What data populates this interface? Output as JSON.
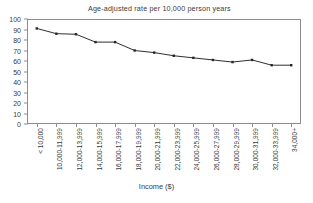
{
  "chart_data": {
    "type": "line",
    "title": "Age-adjusted rate per 10,000 person years",
    "xlabel": "Income ($)",
    "ylabel": "",
    "ylim": [
      0,
      100
    ],
    "yticks": [
      0,
      10,
      20,
      30,
      40,
      50,
      60,
      70,
      80,
      90,
      100
    ],
    "grid": false,
    "legend": "none",
    "marker": "square",
    "categories": [
      "< 10,000",
      "10,000-11,999",
      "12,000-13,999",
      "14,000-15,999",
      "16,000-17,999",
      "18,000-19,999",
      "20,000-21,999",
      "22,000-23,999",
      "24,000-25,999",
      "26,000-27,999",
      "28,000-29,999",
      "30,000-31,999",
      "32,000-33,999",
      "34,000+"
    ],
    "values": [
      91,
      86,
      85.5,
      78,
      78,
      70,
      68,
      65,
      63,
      61,
      59,
      61,
      56,
      56
    ],
    "series": [
      {
        "name": "Age-adjusted rate",
        "values": [
          91,
          86,
          85.5,
          78,
          78,
          70,
          68,
          65,
          63,
          61,
          59,
          61,
          56,
          56
        ]
      }
    ]
  },
  "colors": {
    "line": "#2e2e2e",
    "marker": "#262626",
    "axis": "#8d8d8d",
    "text": "#3a3a3a",
    "background": "#ffffff"
  }
}
